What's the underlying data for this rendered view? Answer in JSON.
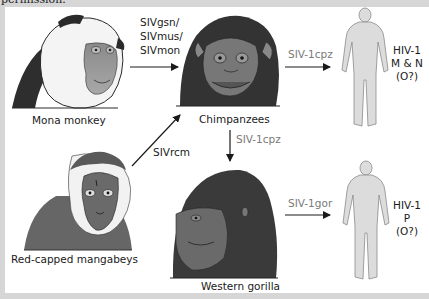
{
  "header_fragment": "permission.",
  "hosts": {
    "mona": "Mona monkey",
    "mangabey": "Red-capped mangabeys",
    "chimp": "Chimpanzees",
    "gorilla": "Western gorilla"
  },
  "transmissions": {
    "mona_to_chimp": [
      "SIVgsn/",
      "SIVmus/",
      "SIVmon"
    ],
    "mangabey_to_chimp": "SIVrcm",
    "chimp_to_human": "SIV-1cpz",
    "chimp_to_gorilla": "SIV-1cpz",
    "gorilla_to_human": "SIV-1gor"
  },
  "outcomes": {
    "human_top": [
      "HIV-1",
      "M & N",
      "(O?)"
    ],
    "human_bottom": [
      "HIV-1",
      "P",
      "(O?)"
    ]
  },
  "colors": {
    "dark_fur": "#3a3a3a",
    "mid_gray": "#6e6e6e",
    "skin": "#9a9a9a",
    "human_fill": "#dcdcdc",
    "human_stroke": "#8a8a8a",
    "arrow": "#1a1a1a"
  }
}
